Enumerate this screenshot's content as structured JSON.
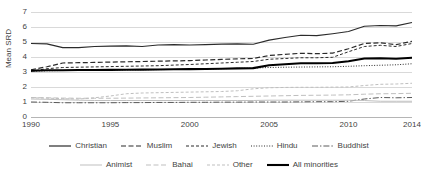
{
  "chart_data": {
    "type": "line",
    "title": "",
    "xlabel": "",
    "ylabel": "Mean SRD",
    "xlim": [
      1990,
      2014
    ],
    "ylim": [
      0,
      7
    ],
    "grid": true,
    "legend_position": "bottom",
    "x": [
      1990,
      1991,
      1992,
      1993,
      1994,
      1995,
      1996,
      1997,
      1998,
      1999,
      2000,
      2001,
      2002,
      2003,
      2004,
      2005,
      2006,
      2007,
      2008,
      2009,
      2010,
      2011,
      2012,
      2013,
      2014
    ],
    "xticks": [
      "1990",
      "1995",
      "2000",
      "2005",
      "2010",
      "2014"
    ],
    "yticks": [
      "0",
      "1",
      "2",
      "3",
      "4",
      "5",
      "6",
      "7"
    ],
    "series": [
      {
        "name": "Christian",
        "style": "solid",
        "color": "#2b2b2b",
        "width": 1.2,
        "values": [
          4.9,
          4.88,
          4.62,
          4.63,
          4.7,
          4.72,
          4.74,
          4.7,
          4.8,
          4.82,
          4.8,
          4.83,
          4.86,
          4.88,
          4.85,
          5.12,
          5.3,
          5.45,
          5.42,
          5.55,
          5.7,
          6.05,
          6.1,
          6.08,
          6.3
        ]
      },
      {
        "name": "Muslim",
        "style": "dashed",
        "color": "#2b2b2b",
        "width": 1.2,
        "values": [
          3.15,
          3.35,
          3.6,
          3.62,
          3.64,
          3.66,
          3.68,
          3.7,
          3.72,
          3.74,
          3.76,
          3.8,
          3.84,
          3.88,
          3.9,
          4.1,
          4.18,
          4.25,
          4.22,
          4.26,
          4.55,
          4.9,
          4.95,
          4.82,
          5.05
        ]
      },
      {
        "name": "Jewish",
        "style": "dashed-fine",
        "color": "#2b2b2b",
        "width": 1.0,
        "values": [
          3.05,
          3.22,
          3.3,
          3.32,
          3.34,
          3.36,
          3.38,
          3.4,
          3.42,
          3.46,
          3.5,
          3.55,
          3.6,
          3.65,
          3.7,
          3.85,
          3.9,
          3.95,
          3.95,
          3.98,
          4.35,
          4.7,
          4.78,
          4.7,
          4.9
        ]
      },
      {
        "name": "Hindu",
        "style": "dotted",
        "color": "#2b2b2b",
        "width": 1.0,
        "values": [
          3.05,
          3.08,
          3.1,
          3.11,
          3.12,
          3.13,
          3.14,
          3.15,
          3.16,
          3.17,
          3.18,
          3.2,
          3.22,
          3.24,
          3.26,
          3.3,
          3.32,
          3.33,
          3.34,
          3.35,
          3.38,
          3.42,
          3.45,
          3.48,
          3.55
        ]
      },
      {
        "name": "Buddhist",
        "style": "dashdot",
        "color": "#5a5a5a",
        "width": 1.0,
        "values": [
          1.0,
          0.98,
          0.95,
          0.95,
          0.95,
          0.95,
          0.96,
          0.96,
          0.97,
          0.97,
          0.98,
          0.98,
          0.99,
          0.99,
          1.0,
          1.0,
          1.0,
          1.01,
          1.02,
          1.02,
          1.05,
          1.2,
          1.3,
          1.28,
          1.3
        ]
      },
      {
        "name": "Animist",
        "style": "solid",
        "color": "#bfbfbf",
        "width": 1.0,
        "values": [
          1.2,
          1.18,
          1.15,
          1.12,
          1.1,
          1.1,
          1.1,
          1.1,
          1.1,
          1.1,
          1.1,
          1.1,
          1.1,
          1.1,
          1.1,
          1.12,
          1.12,
          1.12,
          1.12,
          1.12,
          1.12,
          1.1,
          1.05,
          1.05,
          1.05
        ]
      },
      {
        "name": "Bahai",
        "style": "dashed",
        "color": "#bfbfbf",
        "width": 1.0,
        "values": [
          1.3,
          1.28,
          1.26,
          1.25,
          1.25,
          1.25,
          1.26,
          1.27,
          1.28,
          1.29,
          1.3,
          1.32,
          1.34,
          1.36,
          1.38,
          1.4,
          1.42,
          1.44,
          1.45,
          1.46,
          1.48,
          1.52,
          1.55,
          1.56,
          1.58
        ]
      },
      {
        "name": "Other",
        "style": "dashed-fine",
        "color": "#bfbfbf",
        "width": 1.0,
        "values": [
          1.28,
          1.26,
          1.22,
          1.2,
          1.28,
          1.4,
          1.55,
          1.6,
          1.62,
          1.64,
          1.66,
          1.68,
          1.7,
          1.75,
          1.88,
          1.95,
          1.97,
          1.98,
          1.98,
          1.99,
          2.0,
          2.1,
          2.18,
          2.2,
          2.25
        ]
      },
      {
        "name": "All minorities",
        "style": "solid",
        "color": "#000000",
        "width": 2.1,
        "values": [
          3.08,
          3.12,
          3.12,
          3.13,
          3.13,
          3.14,
          3.15,
          3.16,
          3.17,
          3.18,
          3.19,
          3.2,
          3.22,
          3.24,
          3.26,
          3.45,
          3.52,
          3.58,
          3.58,
          3.6,
          3.72,
          3.9,
          3.92,
          3.88,
          3.95
        ]
      }
    ]
  },
  "legend": {
    "rows": [
      [
        {
          "label": "Christian",
          "series": 0
        },
        {
          "label": "Muslim",
          "series": 1
        },
        {
          "label": "Jewish",
          "series": 2
        },
        {
          "label": "Hindu",
          "series": 3
        },
        {
          "label": "Buddhist",
          "series": 4
        }
      ],
      [
        {
          "label": "Animist",
          "series": 5
        },
        {
          "label": "Bahai",
          "series": 6
        },
        {
          "label": "Other",
          "series": 7
        },
        {
          "label": "All minorities",
          "series": 8
        }
      ]
    ]
  }
}
